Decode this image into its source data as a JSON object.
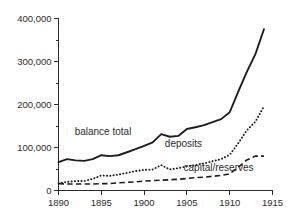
{
  "chart_data": {
    "type": "line",
    "title": "",
    "subtitle": "",
    "xlabel": "",
    "ylabel": "",
    "xlim": [
      1890,
      1915
    ],
    "ylim": [
      0,
      400000
    ],
    "grid": false,
    "legend_position": "inline-annotations",
    "x_ticks": [
      "1890",
      "1895",
      "1900",
      "1905",
      "1910",
      "1915"
    ],
    "x_tick_values": [
      1890,
      1895,
      1900,
      1905,
      1910,
      1915
    ],
    "x_minor_ticks": [
      1892.5,
      1897.5,
      1902.5,
      1907.5,
      1912.5
    ],
    "y_ticks": [
      "0",
      "100,000",
      "200,000",
      "300,000",
      "400,000"
    ],
    "y_tick_values": [
      0,
      100000,
      200000,
      300000,
      400000
    ],
    "y_minor_ticks": [
      50000,
      150000,
      250000,
      350000
    ],
    "x": [
      1890,
      1891,
      1892,
      1893,
      1894,
      1895,
      1896,
      1897,
      1898,
      1899,
      1900,
      1901,
      1902,
      1903,
      1904,
      1905,
      1906,
      1907,
      1908,
      1909,
      1910,
      1911,
      1912,
      1913,
      1914
    ],
    "series": [
      {
        "name": "balance total",
        "style": "solid",
        "label_x": 1895.2,
        "label_y": 128000,
        "values": [
          66000,
          73000,
          70000,
          69000,
          73000,
          82000,
          80000,
          82000,
          89000,
          96000,
          104000,
          112000,
          131000,
          125000,
          127000,
          143000,
          147000,
          152000,
          159000,
          166000,
          182000,
          230000,
          276000,
          317000,
          375000
        ]
      },
      {
        "name": "deposits",
        "style": "dotted",
        "label_x": 1904.6,
        "label_y": 102000,
        "values": [
          17000,
          20000,
          22000,
          22000,
          27000,
          35000,
          34000,
          37000,
          41000,
          45000,
          48000,
          49000,
          59000,
          49000,
          52000,
          56000,
          59000,
          63000,
          68000,
          73000,
          83000,
          110000,
          140000,
          160000,
          196000
        ]
      },
      {
        "name": "capital/reserves",
        "style": "dashed",
        "label_x": 1908.7,
        "label_y": 46000,
        "values": [
          16000,
          15000,
          15000,
          15000,
          15000,
          16000,
          16000,
          18000,
          19000,
          20000,
          22000,
          23000,
          24000,
          25000,
          26000,
          28000,
          30000,
          31000,
          33000,
          35000,
          39000,
          54000,
          71000,
          80000,
          80000
        ]
      }
    ]
  }
}
